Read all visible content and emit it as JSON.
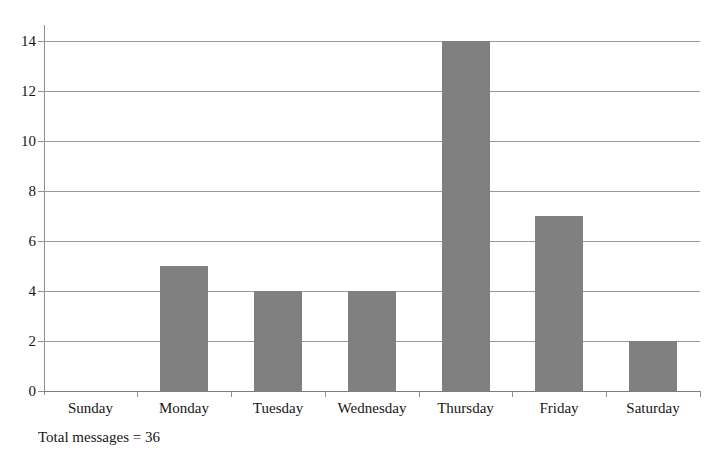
{
  "chart_data": {
    "type": "bar",
    "title": "",
    "subtitle": "",
    "xlabel": "",
    "ylabel": "",
    "categories": [
      "Sunday",
      "Monday",
      "Tuesday",
      "Wednesday",
      "Thursday",
      "Friday",
      "Saturday"
    ],
    "values": [
      0,
      5,
      4,
      4,
      14,
      7,
      2
    ],
    "ylim": [
      0,
      14
    ],
    "ytick_labels": [
      "0",
      "2",
      "4",
      "6",
      "8",
      "10",
      "12",
      "14"
    ],
    "ytick_values": [
      0,
      2,
      4,
      6,
      8,
      10,
      12,
      14
    ],
    "grid": true,
    "grid_axis": "y",
    "legend": false,
    "legend_position": "none",
    "annotation": "Total messages = 36",
    "bar_color": "#808080",
    "grid_color": "#9a9a9a",
    "axis_color": "#8e8e8e",
    "background_color": "#ffffff"
  }
}
